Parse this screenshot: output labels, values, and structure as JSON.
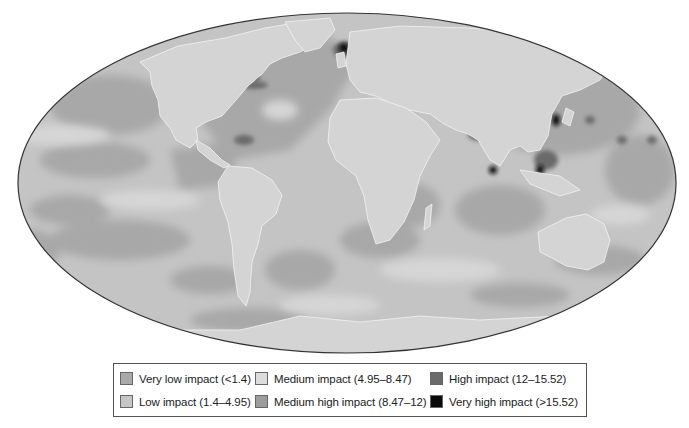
{
  "map": {
    "projection": "Mollweide",
    "description": "Global map of cumulative human impact on marine ecosystems, grayscale",
    "colors": {
      "land": "#d4d4d4",
      "land_borders": "#f2f2f2",
      "outline": "#333333"
    }
  },
  "legend": {
    "items": [
      {
        "label": "Very low impact (<1.4)",
        "color": "#a9a9a9"
      },
      {
        "label": "Low impact (1.4–4.95)",
        "color": "#c6c6c6"
      },
      {
        "label": "Medium impact (4.95–8.47)",
        "color": "#dcdcdc"
      },
      {
        "label": "Medium high impact (8.47–12)",
        "color": "#9c9c9c"
      },
      {
        "label": "High impact (12–15.52)",
        "color": "#6a6a6a"
      },
      {
        "label": "Very high impact (>15.52)",
        "color": "#0a0a0a"
      }
    ]
  }
}
